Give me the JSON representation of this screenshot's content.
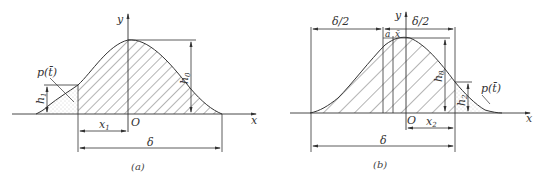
{
  "figures": [
    {
      "id": "a",
      "caption": "(a)",
      "labels": {
        "y_axis": "y",
        "x_axis": "x",
        "origin": "O",
        "density": "p(t̄)",
        "h_left": "h",
        "h_left_sub": "1",
        "h_peak": "h",
        "h_peak_sub": "0",
        "x_dim": "x",
        "x_dim_sub": "1",
        "width_dim": "δ"
      }
    },
    {
      "id": "b",
      "caption": "(b)",
      "labels": {
        "y_axis": "y",
        "x_axis": "x",
        "origin": "O",
        "density": "p(t̄)",
        "half_left": "δ/2",
        "half_right": "δ/2",
        "a_label": "a",
        "xbar_label": "x̄",
        "h_peak": "h",
        "h_peak_sub": "0",
        "h_right": "h",
        "h_right_sub": "2",
        "x_dim": "x",
        "x_dim_sub": "2",
        "width_dim": "δ"
      }
    }
  ],
  "colors": {
    "line": "#333333",
    "hatch": "#444444",
    "stipple": "#999999"
  }
}
